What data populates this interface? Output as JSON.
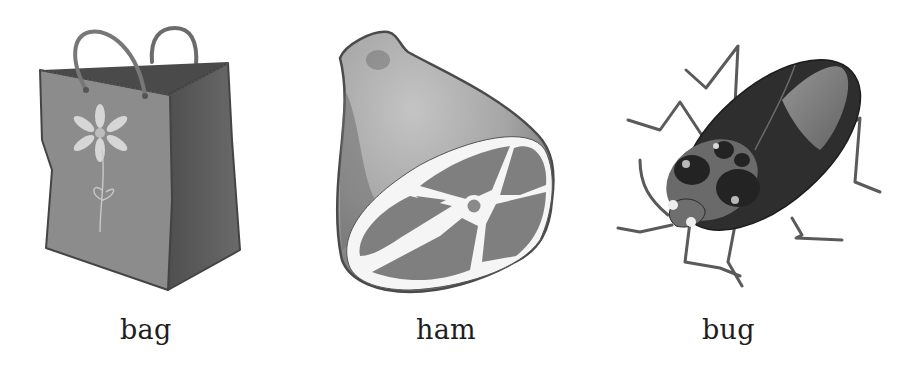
{
  "items": [
    {
      "word": "bag",
      "picture": "shopping-bag-with-flower"
    },
    {
      "word": "ham",
      "picture": "ham-leg-cut"
    },
    {
      "word": "bug",
      "picture": "beetle"
    }
  ],
  "colors": {
    "background": "#ffffff",
    "label_text": "#1e1e1e",
    "bag_front": "#8a8a8a",
    "bag_side": "#5e5e5e",
    "bag_inner": "#4a4a4a",
    "flower": "#d4d4d4",
    "ham_skin_light": "#b9b9b9",
    "ham_skin_dark": "#7a7a7a",
    "ham_meat": "#7e7e7e",
    "ham_fat": "#f4f4f4",
    "bug_body": "#2c2c2c",
    "bug_wing": "#8e8e8e",
    "bug_leg": "#5a5a5a"
  }
}
